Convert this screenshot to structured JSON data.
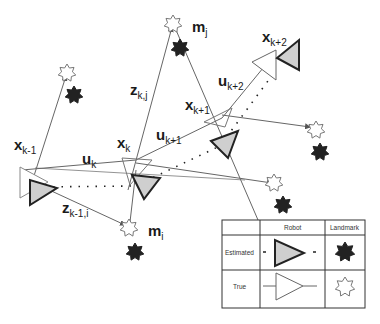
{
  "colors": {
    "line": "#555555",
    "estimated_fill": "#cfcfcf",
    "estimated_stroke": "#222222",
    "landmark_dark": "#222222",
    "true_stroke": "#777777"
  },
  "labels": {
    "x_km1": {
      "base": "x",
      "sub": "k-1"
    },
    "x_k": {
      "base": "x",
      "sub": "k"
    },
    "x_kp1": {
      "base": "x",
      "sub": "k+1"
    },
    "x_kp2": {
      "base": "x",
      "sub": "k+2"
    },
    "u_k": {
      "base": "u",
      "sub": "k"
    },
    "u_kp1": {
      "base": "u",
      "sub": "k+1"
    },
    "u_kp2": {
      "base": "u",
      "sub": "k+2"
    },
    "z_kj": {
      "base": "z",
      "sub": "k,j"
    },
    "z_km1i": {
      "base": "z",
      "sub": "k-1,i"
    },
    "m_i": {
      "base": "m",
      "sub": "i"
    },
    "m_j": {
      "base": "m",
      "sub": "j"
    }
  },
  "legend": {
    "col_robot": "Robot",
    "col_landmark": "Landmark",
    "row_estimated": "Estimated",
    "row_true": "True"
  },
  "icons": {
    "estimated_robot": "filled-triangle-icon",
    "true_robot": "outline-triangle-icon",
    "estimated_landmark": "dark-star-icon",
    "true_landmark": "outline-star-icon"
  }
}
